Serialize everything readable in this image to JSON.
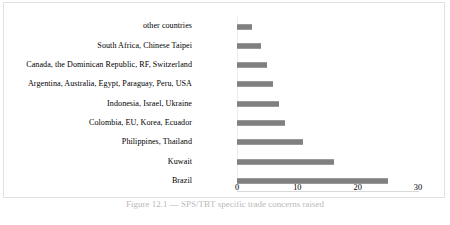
{
  "chart_data": {
    "type": "bar",
    "orientation": "horizontal",
    "title": "",
    "xlabel": "",
    "ylabel": "",
    "xlim": [
      0,
      30
    ],
    "xticks": [
      0,
      10,
      20,
      30
    ],
    "grid": false,
    "legend": false,
    "bar_color": "#808080",
    "categories": [
      "other countries",
      "South Africa, Chinese Taipei",
      "Canada, the Dominican Republic, RF, Switzerland",
      "Argentina, Australia, Egypt, Paraguay, Peru, USA",
      "Indonesia, Israel, Ukraine",
      "Colombia, EU, Korea, Ecuador",
      "Philippines, Thailand",
      "Kuwait",
      "Brazil"
    ],
    "values": [
      2.5,
      4,
      5,
      6,
      7,
      8,
      11,
      16,
      25
    ]
  },
  "caption": {
    "text": "Figure 12.1 — SPS/TBT specific trade concerns raised",
    "visible": "partially clipped"
  }
}
